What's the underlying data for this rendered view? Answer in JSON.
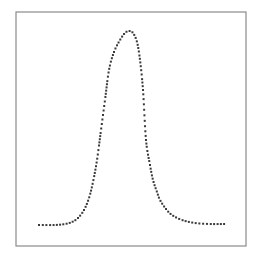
{
  "chart_data": {
    "type": "line",
    "style": "dotted",
    "title": "",
    "xlabel": "",
    "ylabel": "",
    "grid": false,
    "legend": null,
    "frame": {
      "left": 16,
      "top": 12,
      "right": 246,
      "bottom": 246,
      "color": "#8a8a8a"
    },
    "line_color": "#3a3a3a",
    "points_px": [
      [
        39,
        225
      ],
      [
        55,
        225
      ],
      [
        65,
        224
      ],
      [
        72,
        222
      ],
      [
        78,
        218
      ],
      [
        84,
        210
      ],
      [
        89,
        198
      ],
      [
        93,
        182
      ],
      [
        97,
        160
      ],
      [
        101,
        130
      ],
      [
        105,
        100
      ],
      [
        109,
        70
      ],
      [
        114,
        52
      ],
      [
        120,
        40
      ],
      [
        125,
        33
      ],
      [
        129,
        31
      ],
      [
        133,
        33
      ],
      [
        137,
        42
      ],
      [
        140,
        60
      ],
      [
        143,
        90
      ],
      [
        146,
        140
      ],
      [
        150,
        165
      ],
      [
        153,
        180
      ],
      [
        157,
        192
      ],
      [
        160,
        200
      ],
      [
        166,
        209
      ],
      [
        172,
        215
      ],
      [
        182,
        220
      ],
      [
        195,
        223
      ],
      [
        210,
        224
      ],
      [
        225,
        224
      ]
    ],
    "x": [
      0,
      0.09,
      0.14,
      0.18,
      0.21,
      0.24,
      0.27,
      0.29,
      0.31,
      0.33,
      0.35,
      0.38,
      0.4,
      0.43,
      0.46,
      0.48,
      0.5,
      0.53,
      0.54,
      0.56,
      0.58,
      0.6,
      0.61,
      0.63,
      0.65,
      0.68,
      0.71,
      0.77,
      0.84,
      0.92,
      1.0
    ],
    "values": [
      0.0,
      0.0,
      0.005,
      0.016,
      0.036,
      0.078,
      0.141,
      0.224,
      0.339,
      0.495,
      0.651,
      0.807,
      0.901,
      0.964,
      1.0,
      1.01,
      1.0,
      0.953,
      0.859,
      0.703,
      0.443,
      0.313,
      0.234,
      0.172,
      0.13,
      0.083,
      0.052,
      0.026,
      0.01,
      0.005,
      0.005
    ],
    "xlim": [
      0,
      1
    ],
    "ylim": [
      0,
      1.05
    ]
  }
}
